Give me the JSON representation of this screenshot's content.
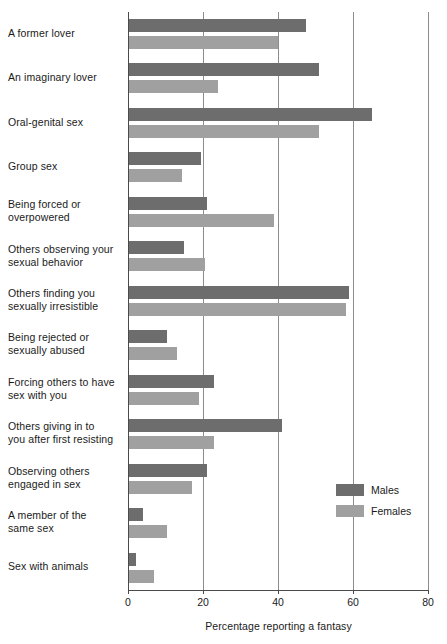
{
  "chart_data": {
    "type": "bar",
    "orientation": "horizontal",
    "title": "",
    "xlabel": "Percentage reporting a fantasy",
    "ylabel": "",
    "xlim": [
      0,
      80
    ],
    "xticks": [
      0,
      20,
      40,
      60,
      80
    ],
    "grid": true,
    "legend_position": "inside-right-lower",
    "categories": [
      "A former lover",
      "An imaginary lover",
      "Oral-genital sex",
      "Group sex",
      "Being forced or overpowered",
      "Others observing your sexual behavior",
      "Others finding you sexually irresistible",
      "Being rejected or sexually abused",
      "Forcing others to have sex with you",
      "Others giving in to you after first resisting",
      "Observing others engaged in sex",
      "A member of the same sex",
      "Sex with animals"
    ],
    "category_lines": [
      [
        "A former lover"
      ],
      [
        "An imaginary lover"
      ],
      [
        "Oral-genital sex"
      ],
      [
        "Group sex"
      ],
      [
        "Being forced or",
        "overpowered"
      ],
      [
        "Others observing your",
        "sexual behavior"
      ],
      [
        "Others finding you",
        "sexually irresistible"
      ],
      [
        "Being rejected or",
        "sexually abused"
      ],
      [
        "Forcing others to have",
        "sex with you"
      ],
      [
        "Others giving in to",
        "you after first resisting"
      ],
      [
        "Observing others",
        "engaged in sex"
      ],
      [
        "A member of the",
        "same sex"
      ],
      [
        "Sex with animals"
      ]
    ],
    "series": [
      {
        "name": "Males",
        "color": "#6d6d6d",
        "values": [
          47.5,
          51,
          65,
          19.5,
          21,
          15,
          59,
          10.5,
          23,
          41,
          21,
          4,
          2
        ]
      },
      {
        "name": "Females",
        "color": "#a0a0a0",
        "values": [
          40,
          24,
          51,
          14.5,
          39,
          20.5,
          58,
          13,
          19,
          23,
          17,
          10.5,
          7
        ]
      }
    ]
  },
  "legend": {
    "items": [
      {
        "label": "Males",
        "color": "#6d6d6d"
      },
      {
        "label": "Females",
        "color": "#a0a0a0"
      }
    ]
  },
  "axis": {
    "x_title": "Percentage reporting a fantasy",
    "x_tick_labels": [
      "0",
      "20",
      "40",
      "60",
      "80"
    ]
  },
  "colors": {
    "males": "#6d6d6d",
    "females": "#a0a0a0",
    "grid": "#8c8c8c",
    "axis": "#4a4a4a",
    "text": "#1a1a1a",
    "background": "#ffffff"
  }
}
